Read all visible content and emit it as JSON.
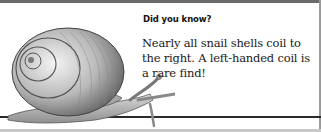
{
  "card": {
    "kicker": "Did you know?",
    "fact": "Nearly all snail shells coil to the right. A left-handed coil is a rare find!",
    "illustration": "snail-illustration"
  }
}
